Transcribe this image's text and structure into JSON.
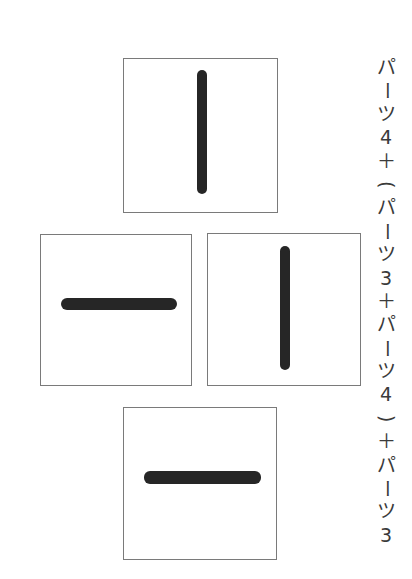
{
  "caption": {
    "text": "パーツ4＋(パーツ3＋パーツ4)＋パーツ3",
    "chars": [
      "パ",
      "ー",
      "ツ",
      "4",
      "＋",
      "(",
      "パ",
      "ー",
      "ツ",
      "3",
      "＋",
      "パ",
      "ー",
      "ツ",
      "4",
      ")",
      "＋",
      "パ",
      "ー",
      "ツ",
      "3"
    ],
    "rotated_indices": [
      1,
      5,
      7,
      13,
      15,
      18
    ]
  },
  "panels": [
    {
      "id": "top",
      "part": "パーツ4",
      "stroke": "vertical",
      "box": {
        "x": 123,
        "y": 58,
        "w": 155,
        "h": 155
      },
      "line": {
        "x": 197,
        "y": 70,
        "w": 10,
        "h": 124
      }
    },
    {
      "id": "left",
      "part": "パーツ3",
      "stroke": "horizontal",
      "box": {
        "x": 40,
        "y": 234,
        "w": 152,
        "h": 152
      },
      "line": {
        "x": 61,
        "y": 298,
        "w": 116,
        "h": 12
      }
    },
    {
      "id": "right",
      "part": "パーツ4",
      "stroke": "vertical",
      "box": {
        "x": 207,
        "y": 233,
        "w": 154,
        "h": 153
      },
      "line": {
        "x": 280,
        "y": 246,
        "w": 10,
        "h": 124
      }
    },
    {
      "id": "bottom",
      "part": "パーツ3",
      "stroke": "horizontal",
      "box": {
        "x": 123,
        "y": 407,
        "w": 154,
        "h": 153
      },
      "line": {
        "x": 144,
        "y": 471,
        "w": 117,
        "h": 13
      }
    }
  ],
  "colors": {
    "stroke": "#262626",
    "border": "#7a7a7a",
    "text": "#3a3a3a",
    "background": "#ffffff"
  }
}
